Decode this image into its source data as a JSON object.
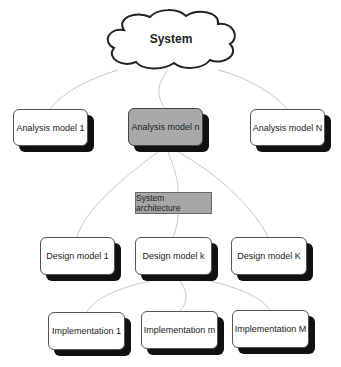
{
  "diagram": {
    "root": {
      "label": "System",
      "shape": "cloud"
    },
    "analysis_models": [
      {
        "label": "Analysis model 1",
        "highlighted": false
      },
      {
        "label": "Analysis model n",
        "highlighted": true
      },
      {
        "label": "Analysis model N",
        "highlighted": false
      }
    ],
    "architecture": {
      "label": "System architecture"
    },
    "design_models": [
      {
        "label": "Design model 1"
      },
      {
        "label": "Design model k"
      },
      {
        "label": "Design model K"
      }
    ],
    "implementations": [
      {
        "label": "Implementation 1"
      },
      {
        "label": "Implementation m"
      },
      {
        "label": "Implementation M"
      }
    ],
    "edges": [
      [
        "System",
        "Analysis model 1"
      ],
      [
        "System",
        "Analysis model n"
      ],
      [
        "System",
        "Analysis model N"
      ],
      [
        "Analysis model n",
        "Design model 1"
      ],
      [
        "Analysis model n",
        "System architecture"
      ],
      [
        "System architecture",
        "Design model k"
      ],
      [
        "Analysis model n",
        "Design model K"
      ],
      [
        "Design model k",
        "Implementation 1"
      ],
      [
        "Design model k",
        "Implementation m"
      ],
      [
        "Design model k",
        "Implementation M"
      ]
    ],
    "colors": {
      "highlight_fill": "#a9a9a9",
      "architecture_fill": "#a6a6a6",
      "shadow": "#111111",
      "edge": "#c8c8c8"
    }
  }
}
